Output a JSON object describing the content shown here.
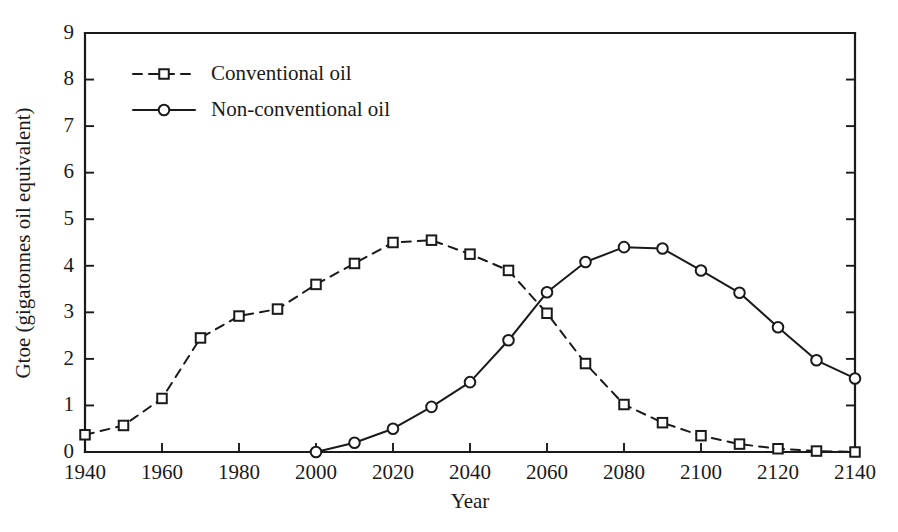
{
  "chart_data": {
    "type": "line",
    "title": "",
    "xlabel": "Year",
    "ylabel": "Gtoe (gigatonnes oil equivalent)",
    "xlim": [
      1940,
      2140
    ],
    "ylim": [
      0,
      9
    ],
    "xticks": [
      1940,
      1960,
      1980,
      2000,
      2020,
      2040,
      2060,
      2080,
      2100,
      2120,
      2140
    ],
    "yticks": [
      0,
      1,
      2,
      3,
      4,
      5,
      6,
      7,
      8,
      9
    ],
    "xtick_labels": [
      "1940",
      "1960",
      "1980",
      "2000",
      "2020",
      "2040",
      "2060",
      "2080",
      "2100",
      "2120",
      "2140"
    ],
    "ytick_labels": [
      "0",
      "1",
      "2",
      "3",
      "4",
      "5",
      "6",
      "7",
      "8",
      "9"
    ],
    "grid": false,
    "legend_position": "top-left",
    "line_color": "#1a1a1a",
    "background_color": "#ffffff",
    "series": [
      {
        "name": "Conventional oil",
        "marker": "square-open",
        "linestyle": "dashed",
        "x": [
          1940,
          1950,
          1960,
          1970,
          1980,
          1990,
          2000,
          2010,
          2020,
          2030,
          2040,
          2050,
          2060,
          2070,
          2080,
          2090,
          2100,
          2110,
          2120,
          2130,
          2140
        ],
        "values": [
          0.37,
          0.57,
          1.15,
          2.45,
          2.92,
          3.07,
          3.6,
          4.05,
          4.5,
          4.55,
          4.25,
          3.9,
          2.98,
          1.9,
          1.02,
          0.63,
          0.35,
          0.17,
          0.07,
          0.02,
          0.0
        ]
      },
      {
        "name": "Non-conventional oil",
        "marker": "circle-open",
        "linestyle": "solid",
        "x": [
          2000,
          2010,
          2020,
          2030,
          2040,
          2050,
          2060,
          2070,
          2080,
          2090,
          2100,
          2110,
          2120,
          2130,
          2140
        ],
        "values": [
          0.0,
          0.2,
          0.5,
          0.97,
          1.5,
          2.4,
          3.43,
          4.08,
          4.4,
          4.37,
          3.9,
          3.42,
          2.68,
          1.97,
          1.58
        ]
      }
    ]
  },
  "legend": {
    "entries": [
      {
        "label": "Conventional oil"
      },
      {
        "label": "Non-conventional oil"
      }
    ]
  }
}
